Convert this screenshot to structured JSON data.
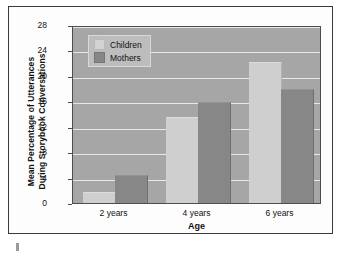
{
  "chart_data": {
    "type": "bar",
    "title": "",
    "xlabel": "Age",
    "ylabel": "Mean Percentage of Utterances During Storybook Conversations",
    "categories": [
      "2 years",
      "4 years",
      "6 years"
    ],
    "series": [
      {
        "name": "Children",
        "values": [
          1.5,
          13.3,
          22.0
        ],
        "color": "#cfcfcf"
      },
      {
        "name": "Mothers",
        "values": [
          4.2,
          15.8,
          17.8
        ],
        "color": "#878787"
      }
    ],
    "ylim": [
      0,
      28
    ],
    "yticks": [
      0,
      4,
      8,
      12,
      16,
      20,
      24,
      28
    ],
    "ytick_labels": [
      "0",
      "4",
      "8",
      "12",
      "16",
      "20",
      "24",
      "28"
    ],
    "grid": true,
    "legend_position": "top-left",
    "plot_background": "#a6a6a6",
    "gridline_color": "#e8e8e8",
    "frame_color": "#3a3a3a"
  },
  "ylabel_line1": "Mean Percentage of Utterances",
  "ylabel_line2": "During Storybook Conversations"
}
